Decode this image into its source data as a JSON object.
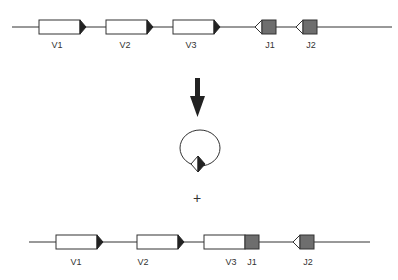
{
  "diagram": {
    "colors": {
      "line": "#333333",
      "v_box": "#ffffff",
      "j_box": "#6e6e6e",
      "triangle_dark": "#222222",
      "triangle_light": "#ffffff"
    },
    "top_row": {
      "segments": [
        {
          "id": "V1",
          "label": "V1"
        },
        {
          "id": "V2",
          "label": "V2"
        },
        {
          "id": "V3",
          "label": "V3"
        },
        {
          "id": "J1",
          "label": "J1"
        },
        {
          "id": "J2",
          "label": "J2"
        }
      ]
    },
    "arrow": {
      "direction": "down"
    },
    "excised_circle": {
      "label": "excised circle with signal joint"
    },
    "plus_sign": "+",
    "bottom_row": {
      "segments": [
        {
          "id": "V1",
          "label": "V1"
        },
        {
          "id": "V2",
          "label": "V2"
        },
        {
          "id": "V3",
          "label": "V3"
        },
        {
          "id": "J1",
          "label": "J1"
        },
        {
          "id": "J2",
          "label": "J2"
        }
      ]
    }
  }
}
